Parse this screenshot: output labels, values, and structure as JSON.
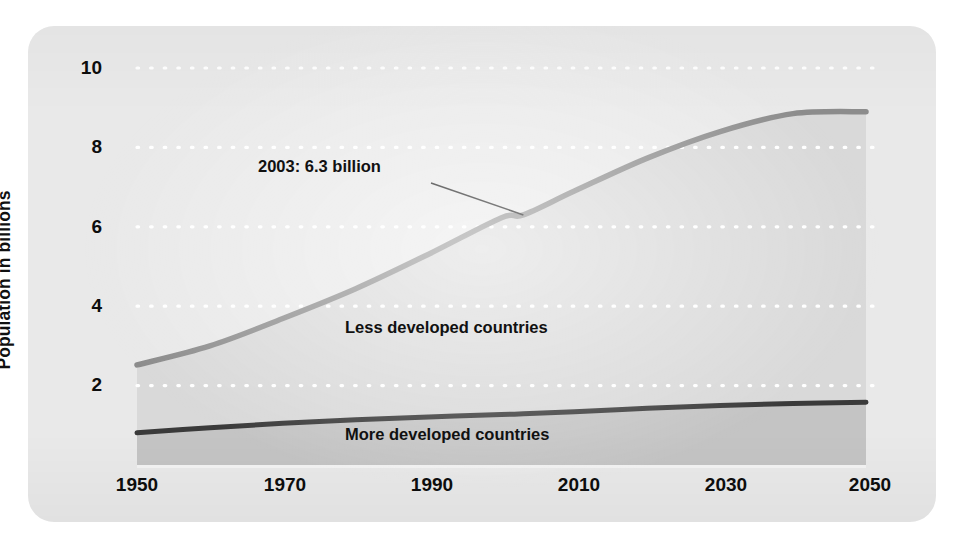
{
  "figure": {
    "background_color": "#e9e9e9",
    "page_color": "#ffffff"
  },
  "axes": {
    "ylabel": "Population in billions",
    "yticks": [
      "10",
      "8",
      "6",
      "4",
      "2"
    ],
    "ytick_values": [
      10,
      8,
      6,
      4,
      2
    ],
    "xticks": [
      "1950",
      "1970",
      "1990",
      "2010",
      "2030",
      "2050"
    ],
    "xtick_values": [
      1950,
      1970,
      1990,
      2010,
      2030,
      2050
    ]
  },
  "labels": {
    "less_developed": "Less developed countries",
    "more_developed": "More developed countries",
    "annotation": "2003: 6.3 billion"
  },
  "colors": {
    "total_line": "#8c8c8c",
    "more_developed_line": "#3a3a3a",
    "less_developed_fill": "#d9d9d9",
    "more_developed_fill": "#c4c4c4",
    "gridline": "#ffffff",
    "text": "#111111"
  },
  "chart_data": {
    "type": "area",
    "title": "",
    "subtitle": "",
    "xlabel": "",
    "ylabel": "Population in billions",
    "xlim": [
      1950,
      2050
    ],
    "ylim": [
      0,
      10
    ],
    "grid": true,
    "grid_style": "dotted-white-horizontal",
    "legend_position": "inline-labels",
    "stacked": true,
    "x": [
      1950,
      1960,
      1970,
      1980,
      1990,
      2000,
      2003,
      2010,
      2020,
      2030,
      2040,
      2050
    ],
    "series": [
      {
        "name": "More developed countries",
        "values": [
          0.81,
          0.94,
          1.05,
          1.14,
          1.21,
          1.27,
          1.29,
          1.34,
          1.43,
          1.5,
          1.55,
          1.58
        ]
      },
      {
        "name": "Less developed countries",
        "values": [
          1.71,
          2.06,
          2.64,
          3.3,
          4.1,
          4.96,
          5.01,
          5.56,
          6.3,
          6.9,
          7.3,
          7.32
        ]
      }
    ],
    "totals": {
      "name": "World total",
      "values": [
        2.52,
        3.0,
        3.69,
        4.44,
        5.31,
        6.23,
        6.3,
        6.9,
        7.73,
        8.4,
        8.85,
        8.9
      ]
    },
    "annotations": [
      {
        "text": "2003: 6.3 billion",
        "x": 2003,
        "y": 6.3,
        "points_to": "world-total-line"
      }
    ]
  }
}
